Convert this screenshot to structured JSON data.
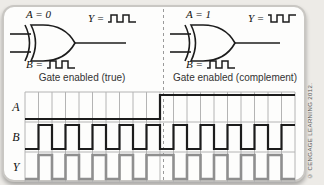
{
  "panels": [
    {
      "control": "A = 0",
      "output_prefix": "Y =",
      "input_prefix": "B =",
      "caption": "Gate enabled (true)",
      "output_wave": "low-first",
      "input_wave": "low-first"
    },
    {
      "control": "A = 1",
      "output_prefix": "Y =",
      "input_prefix": "B =",
      "caption": "Gate enabled (complement)",
      "output_wave": "high-first",
      "input_wave": "low-first"
    }
  ],
  "timing": {
    "columns": 20,
    "rows": [
      {
        "label": "A",
        "color": "dark",
        "levels": [
          0,
          0,
          0,
          0,
          0,
          0,
          0,
          0,
          0,
          0,
          1,
          1,
          1,
          1,
          1,
          1,
          1,
          1,
          1,
          1
        ]
      },
      {
        "label": "B",
        "color": "dark",
        "levels": [
          0,
          1,
          0,
          1,
          0,
          1,
          0,
          1,
          0,
          1,
          0,
          1,
          0,
          1,
          0,
          1,
          0,
          1,
          0,
          1
        ]
      },
      {
        "label": "Y",
        "color": "gray",
        "levels": [
          0,
          1,
          0,
          1,
          0,
          1,
          0,
          1,
          0,
          1,
          1,
          0,
          1,
          0,
          1,
          0,
          1,
          0,
          1,
          0
        ]
      }
    ]
  },
  "credit": "© CENGAGE LEARNING 2012.",
  "colors": {
    "trace_dark": "#1c1c1c",
    "trace_gray": "#8f8f8f",
    "grid": "#b4b4b4",
    "divider": "#9a9a9a",
    "gate_stroke": "#1c1c1c"
  }
}
